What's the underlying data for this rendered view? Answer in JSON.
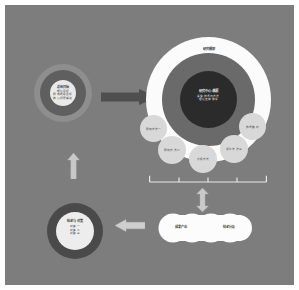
{
  "slide": {
    "background_color": "#7d7d7d",
    "page_color": "#ffffff"
  },
  "colors": {
    "slide_bg": "#7d7d7d",
    "donut_outer_light": "#8e8e8e",
    "donut_mid_dark": "#5f5f5f",
    "core_white": "#e9e9e9",
    "main_ring_white": "#fbfbfb",
    "main_ring_mid": "#6a6a6a",
    "main_core_dark": "#2b2b2b",
    "satellite_fill": "#d8d8d8",
    "arrow_dark": "#4f4f4f",
    "arrow_light": "#c9c9c9",
    "cloud_fill": "#fcfcfc",
    "bottom_ring_dark": "#4a4a4a"
  },
  "top_left_node": {
    "name": "top-left-concentric-node",
    "title": "总体目标",
    "lines": [
      "理论目标",
      "研究的总目标",
      "核心问题解决"
    ]
  },
  "main_node": {
    "name": "main-concentric-node",
    "outer_ring_label": "研究框架",
    "core_title": "研究中心课题",
    "core_lines": [
      "关键技术与方法",
      "理论支撑体系"
    ]
  },
  "satellites": [
    {
      "label": "研究方法一"
    },
    {
      "label": "研究方法二"
    },
    {
      "label": "分析方法"
    },
    {
      "label": "评价方法三"
    },
    {
      "label": "技术路线"
    }
  ],
  "bracket": {
    "name": "measurement-bracket",
    "tick_count": 5
  },
  "cloud_node": {
    "name": "outcome-cloud",
    "labels": [
      "成果产出",
      "结论分析"
    ]
  },
  "bottom_left_node": {
    "name": "bottom-left-node",
    "title": "结论与对策",
    "lines": [
      "对策一",
      "对策二",
      "对策三"
    ]
  },
  "arrows": {
    "right_arrow": {
      "name": "arrow-right-dark",
      "direction": "right",
      "style": "solid-dark"
    },
    "down_arrow": {
      "name": "arrow-down-light",
      "direction": "down",
      "style": "light"
    },
    "left_arrow": {
      "name": "arrow-left-light",
      "direction": "left",
      "style": "light"
    },
    "up_arrow": {
      "name": "arrow-up-light",
      "direction": "up",
      "style": "light"
    }
  }
}
